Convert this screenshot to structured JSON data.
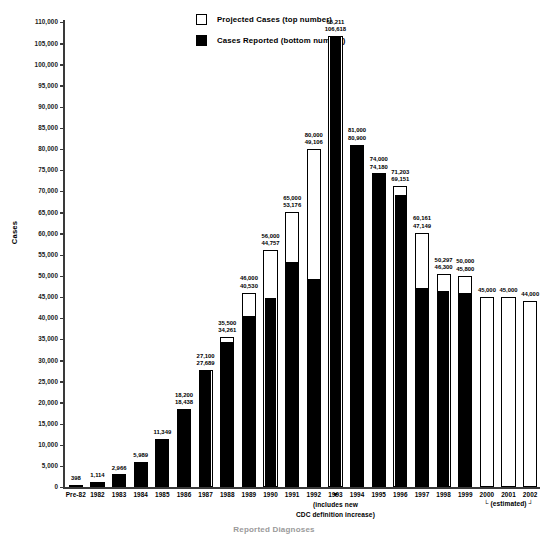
{
  "chart_data": {
    "type": "bar",
    "title": "",
    "xlabel": "",
    "ylabel": "Cases",
    "ylim": [
      0,
      110000
    ],
    "ytick_step": 5000,
    "grid": false,
    "legend_position": "top-center",
    "categories": [
      "Pre-82",
      "1982",
      "1983",
      "1984",
      "1985",
      "1986",
      "1987",
      "1988",
      "1989",
      "1990",
      "1991",
      "1992",
      "1993",
      "1994",
      "1995",
      "1996",
      "1997",
      "1998",
      "1999",
      "2000",
      "2001",
      "2002"
    ],
    "series": [
      {
        "name": "Projected Cases (top number)",
        "values": [
          null,
          null,
          null,
          null,
          null,
          18200,
          27100,
          35500,
          46000,
          56000,
          65000,
          80000,
          65211,
          81000,
          74000,
          71203,
          60161,
          50297,
          50000,
          45000,
          45000,
          44000
        ]
      },
      {
        "name": "Cases Reported (bottom number)",
        "values": [
          398,
          1114,
          2966,
          5989,
          11349,
          18438,
          27689,
          34261,
          40530,
          44757,
          53176,
          49106,
          106618,
          80900,
          74180,
          69151,
          47149,
          46300,
          45800,
          null,
          null,
          null
        ]
      }
    ],
    "ytick_labels": [
      "110,000",
      "105,000",
      "100,000",
      "95,000",
      "90,000",
      "85,000",
      "80,000",
      "75,000",
      "70,000",
      "65,000",
      "60,000",
      "55,000",
      "50,000",
      "45,000",
      "40,000",
      "35,000",
      "30,000",
      "25,000",
      "20,000",
      "15,000",
      "10,000",
      "5,000",
      "0"
    ],
    "bar_labels": [
      {
        "category": "Pre-82",
        "top": "",
        "bottom": "398"
      },
      {
        "category": "1982",
        "top": "",
        "bottom": "1,114"
      },
      {
        "category": "1983",
        "top": "",
        "bottom": "2,966"
      },
      {
        "category": "1984",
        "top": "",
        "bottom": "5,989"
      },
      {
        "category": "1985",
        "top": "",
        "bottom": "11,349"
      },
      {
        "category": "1986",
        "top": "18,200",
        "bottom": "18,438"
      },
      {
        "category": "1987",
        "top": "27,100",
        "bottom": "27,689"
      },
      {
        "category": "1988",
        "top": "35,500",
        "bottom": "34,261"
      },
      {
        "category": "1989",
        "top": "46,000",
        "bottom": "40,530"
      },
      {
        "category": "1990",
        "top": "56,000",
        "bottom": "44,757"
      },
      {
        "category": "1991",
        "top": "65,000",
        "bottom": "53,176"
      },
      {
        "category": "1992",
        "top": "80,000",
        "bottom": "49,106"
      },
      {
        "category": "1993",
        "top": "65,211",
        "bottom": "106,618"
      },
      {
        "category": "1994",
        "top": "81,000",
        "bottom": "80,900"
      },
      {
        "category": "1995",
        "top": "74,000",
        "bottom": "74,180"
      },
      {
        "category": "1996",
        "top": "71,203",
        "bottom": "69,151"
      },
      {
        "category": "1997",
        "top": "60,161",
        "bottom": "47,149"
      },
      {
        "category": "1998",
        "top": "50,297",
        "bottom": "46,300"
      },
      {
        "category": "1999",
        "top": "50,000",
        "bottom": "45,800"
      },
      {
        "category": "2000",
        "top": "45,000",
        "bottom": ""
      },
      {
        "category": "2001",
        "top": "45,000",
        "bottom": ""
      },
      {
        "category": "2002",
        "top": "44,000",
        "bottom": ""
      }
    ],
    "annotations": [
      {
        "name": "cdc-definition-note",
        "text": "(includes new\nCDC definition increase)",
        "points_to": "1993"
      },
      {
        "name": "estimated-note",
        "text": "(estimated)",
        "covers": [
          "2000",
          "2001",
          "2002"
        ]
      }
    ]
  },
  "legend": {
    "items": [
      {
        "swatch": "open",
        "label": "Projected Cases (top number)"
      },
      {
        "swatch": "filled",
        "label": "Cases Reported (bottom number)"
      }
    ]
  },
  "annotations": {
    "cdc_note_line1": "(includes new",
    "cdc_note_line2": "CDC definition increase)",
    "estimated_label": "└ (estimated) ┘",
    "arrow_glyph": "▼"
  },
  "bottom_caption": "Reported Diagnoses"
}
